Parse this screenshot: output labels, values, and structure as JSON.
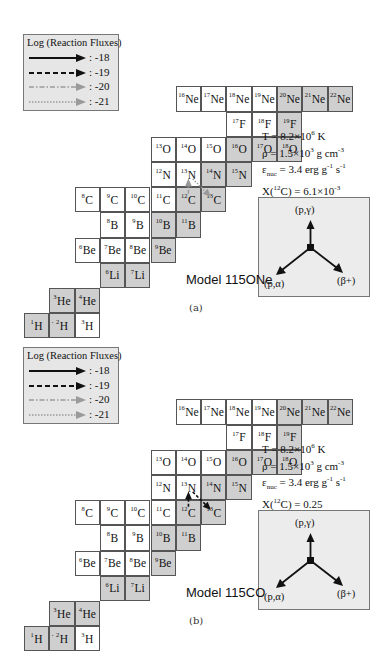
{
  "legend": {
    "title": "Log (Reaction Fluxes)",
    "entries": [
      {
        "style": "solid-black",
        "value": ": -18"
      },
      {
        "style": "dashed-black",
        "value": ": -19"
      },
      {
        "style": "dashdot-gray",
        "value": ": -20"
      },
      {
        "style": "dotted-gray",
        "value": ": -21"
      }
    ]
  },
  "nuclides": [
    {
      "sym": "H",
      "A": "1",
      "col": 0,
      "row": 11,
      "stable": true
    },
    {
      "sym": "H",
      "A": "2",
      "col": 1,
      "row": 11,
      "stable": true
    },
    {
      "sym": "H",
      "A": "3",
      "col": 2,
      "row": 11,
      "stable": false
    },
    {
      "sym": "He",
      "A": "3",
      "col": 1,
      "row": 10,
      "stable": true
    },
    {
      "sym": "He",
      "A": "4",
      "col": 2,
      "row": 10,
      "stable": true
    },
    {
      "sym": "Li",
      "A": "6",
      "col": 3,
      "row": 9,
      "stable": true
    },
    {
      "sym": "Li",
      "A": "7",
      "col": 4,
      "row": 9,
      "stable": true
    },
    {
      "sym": "Be",
      "A": "6",
      "col": 2,
      "row": 8,
      "stable": false
    },
    {
      "sym": "Be",
      "A": "7",
      "col": 3,
      "row": 8,
      "stable": false
    },
    {
      "sym": "Be",
      "A": "8",
      "col": 4,
      "row": 8,
      "stable": false
    },
    {
      "sym": "Be",
      "A": "9",
      "col": 5,
      "row": 8,
      "stable": true
    },
    {
      "sym": "B",
      "A": "8",
      "col": 3,
      "row": 7,
      "stable": false
    },
    {
      "sym": "B",
      "A": "9",
      "col": 4,
      "row": 7,
      "stable": false
    },
    {
      "sym": "B",
      "A": "10",
      "col": 5,
      "row": 7,
      "stable": true
    },
    {
      "sym": "B",
      "A": "11",
      "col": 6,
      "row": 7,
      "stable": true
    },
    {
      "sym": "C",
      "A": "8",
      "col": 2,
      "row": 6,
      "stable": false
    },
    {
      "sym": "C",
      "A": "9",
      "col": 3,
      "row": 6,
      "stable": false
    },
    {
      "sym": "C",
      "A": "10",
      "col": 4,
      "row": 6,
      "stable": false
    },
    {
      "sym": "C",
      "A": "11",
      "col": 5,
      "row": 6,
      "stable": false
    },
    {
      "sym": "C",
      "A": "12",
      "col": 6,
      "row": 6,
      "stable": true
    },
    {
      "sym": "C",
      "A": "13",
      "col": 7,
      "row": 6,
      "stable": true
    },
    {
      "sym": "N",
      "A": "12",
      "col": 5,
      "row": 5,
      "stable": false
    },
    {
      "sym": "N",
      "A": "13",
      "col": 6,
      "row": 5,
      "stable": false
    },
    {
      "sym": "N",
      "A": "14",
      "col": 7,
      "row": 5,
      "stable": true
    },
    {
      "sym": "N",
      "A": "15",
      "col": 8,
      "row": 5,
      "stable": true
    },
    {
      "sym": "O",
      "A": "13",
      "col": 5,
      "row": 4,
      "stable": false
    },
    {
      "sym": "O",
      "A": "14",
      "col": 6,
      "row": 4,
      "stable": false
    },
    {
      "sym": "O",
      "A": "15",
      "col": 7,
      "row": 4,
      "stable": false
    },
    {
      "sym": "O",
      "A": "16",
      "col": 8,
      "row": 4,
      "stable": true
    },
    {
      "sym": "O",
      "A": "17",
      "col": 9,
      "row": 4,
      "stable": true
    },
    {
      "sym": "O",
      "A": "18",
      "col": 10,
      "row": 4,
      "stable": true
    },
    {
      "sym": "F",
      "A": "17",
      "col": 8,
      "row": 3,
      "stable": false
    },
    {
      "sym": "F",
      "A": "18",
      "col": 9,
      "row": 3,
      "stable": false
    },
    {
      "sym": "F",
      "A": "19",
      "col": 10,
      "row": 3,
      "stable": true
    },
    {
      "sym": "Ne",
      "A": "16",
      "col": 6,
      "row": 2,
      "stable": false
    },
    {
      "sym": "Ne",
      "A": "17",
      "col": 7,
      "row": 2,
      "stable": false
    },
    {
      "sym": "Ne",
      "A": "18",
      "col": 8,
      "row": 2,
      "stable": false
    },
    {
      "sym": "Ne",
      "A": "19",
      "col": 9,
      "row": 2,
      "stable": false
    },
    {
      "sym": "Ne",
      "A": "20",
      "col": 10,
      "row": 2,
      "stable": true
    },
    {
      "sym": "Ne",
      "A": "21",
      "col": 11,
      "row": 2,
      "stable": true
    },
    {
      "sym": "Ne",
      "A": "22",
      "col": 12,
      "row": 2,
      "stable": true
    }
  ],
  "inset": {
    "up_label": "(p,γ)",
    "left_label": "(p,α)",
    "right_label": "(β+)"
  },
  "panels": [
    {
      "id": "a",
      "model_label": "Model 115ONe",
      "caption": "(a)",
      "params": {
        "T": "T = 8.2×10",
        "T_exp": "6",
        "T_unit": " K",
        "rho": "ρ = 1.5×10",
        "rho_exp": "3",
        "rho_unit": " g cm",
        "rho_unit_exp": "-3",
        "eps": "ε",
        "eps_sub": "nuc",
        "eps_val": " = 3.4 erg g",
        "eps_exp1": "-1",
        "eps_s": " s",
        "eps_exp2": "-1",
        "X": "X(",
        "X_A": "12",
        "X_rest": "C) = ",
        "X_val": "6.1×10",
        "X_exp": "-3"
      },
      "flux_arrows": [
        {
          "from": "H1",
          "to": "H2",
          "style": "solid-black"
        },
        {
          "from": "C12",
          "to": "N13",
          "style": "dashdot-gray"
        },
        {
          "from": "N13",
          "to": "C13",
          "style": "dotted-gray"
        }
      ]
    },
    {
      "id": "b",
      "model_label": "Model 115CO",
      "caption": "(b)",
      "params": {
        "T": "T = 8.2×10",
        "T_exp": "6",
        "T_unit": " K",
        "rho": "ρ = 1.5×10",
        "rho_exp": "3",
        "rho_unit": " g cm",
        "rho_unit_exp": "-3",
        "eps": "ε",
        "eps_sub": "nuc",
        "eps_val": " = 3.4 erg g",
        "eps_exp1": "-1",
        "eps_s": " s",
        "eps_exp2": "-1",
        "X": "X(",
        "X_A": "12",
        "X_rest": "C) = ",
        "X_val": "0.25",
        "X_exp": ""
      },
      "flux_arrows": [
        {
          "from": "H1",
          "to": "H2",
          "style": "solid-black"
        },
        {
          "from": "C12",
          "to": "N13",
          "style": "dashed-black"
        },
        {
          "from": "N13",
          "to": "C13",
          "style": "dashed-black"
        }
      ]
    }
  ]
}
